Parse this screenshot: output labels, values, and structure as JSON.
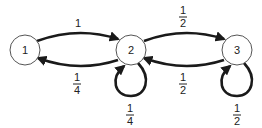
{
  "diagram": {
    "type": "markov-chain",
    "nodes": [
      {
        "id": "1",
        "label": "1"
      },
      {
        "id": "2",
        "label": "2"
      },
      {
        "id": "3",
        "label": "3"
      }
    ],
    "edges": [
      {
        "from": "1",
        "to": "2",
        "label": {
          "num": "1",
          "den": ""
        }
      },
      {
        "from": "2",
        "to": "1",
        "label": {
          "num": "1",
          "den": "4"
        }
      },
      {
        "from": "2",
        "to": "2",
        "label": {
          "num": "1",
          "den": "4"
        }
      },
      {
        "from": "2",
        "to": "3",
        "label": {
          "num": "1",
          "den": "2"
        }
      },
      {
        "from": "3",
        "to": "2",
        "label": {
          "num": "1",
          "den": "2"
        }
      },
      {
        "from": "3",
        "to": "3",
        "label": {
          "num": "1",
          "den": "2"
        }
      }
    ]
  }
}
